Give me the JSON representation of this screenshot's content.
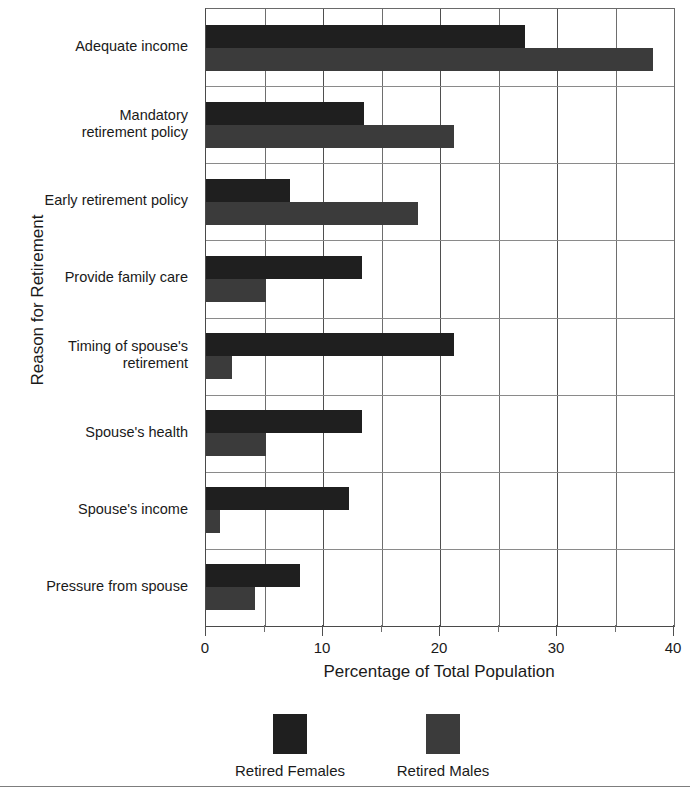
{
  "chart_data": {
    "type": "bar",
    "orientation": "horizontal",
    "title": "",
    "xlabel": "Percentage of Total Population",
    "ylabel": "Reason for Retirement",
    "xlim": [
      0,
      40
    ],
    "xticks": [
      0,
      10,
      20,
      30,
      40
    ],
    "xtick_labels": [
      "0",
      "10",
      "20",
      "30",
      "40"
    ],
    "minor_xticks": [
      5,
      15,
      25,
      35
    ],
    "grid": "vertical gridlines at every 5 units; horizontal separators between categories",
    "legend_position": "bottom",
    "categories": [
      "Adequate income",
      "Mandatory retirement policy",
      "Early retirement policy",
      "Provide family care",
      "Timing of spouse's retirement",
      "Spouse's health",
      "Spouse's income",
      "Pressure from spouse"
    ],
    "category_lines": [
      [
        "Adequate income"
      ],
      [
        "Mandatory",
        "retirement policy"
      ],
      [
        "Early retirement policy"
      ],
      [
        "Provide family care"
      ],
      [
        "Timing of spouse's",
        "retirement"
      ],
      [
        "Spouse's health"
      ],
      [
        "Spouse's income"
      ],
      [
        "Pressure from spouse"
      ]
    ],
    "series": [
      {
        "name": "Retired Females",
        "color": "#1f1f1f",
        "values": [
          27.3,
          13.5,
          7.2,
          13.3,
          21.2,
          13.3,
          12.2,
          8.0
        ]
      },
      {
        "name": "Retired Males",
        "color": "#3b3b3b",
        "values": [
          38.2,
          21.2,
          18.1,
          5.1,
          2.2,
          5.1,
          1.2,
          4.2
        ]
      }
    ]
  },
  "legend": {
    "entries": [
      {
        "label": "Retired Females",
        "swatch": "female"
      },
      {
        "label": "Retired Males",
        "swatch": "male"
      }
    ]
  }
}
